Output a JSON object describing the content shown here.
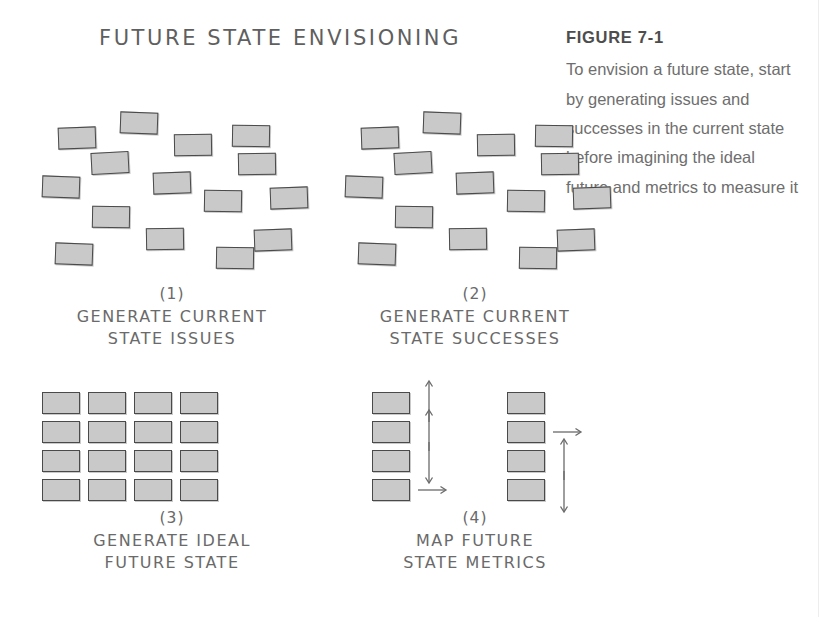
{
  "figure": {
    "number_label": "FIGURE 7-1",
    "caption": "To envision a future state, start by generating issues and successes in the current state before imagining the ideal future and metrics to measure it"
  },
  "diagram": {
    "title": "FUTURE STATE ENVISIONING",
    "colors": {
      "note_fill": "#c9c9c9",
      "note_border": "#4a4a4a",
      "ink": "#6a6a6a",
      "caption_text": "#6e6e6e",
      "figure_heading": "#4d4d4d",
      "background": "#ffffff"
    },
    "panels": [
      {
        "id": "panel-1",
        "step_number": "(1)",
        "label_line1": "GENERATE CURRENT",
        "label_line2": "STATE ISSUES",
        "arrangement": "scatter",
        "note_count": 14,
        "notes": [
          {
            "x": 16,
            "y": 15,
            "rot": -2
          },
          {
            "x": 78,
            "y": 0,
            "rot": 2
          },
          {
            "x": 132,
            "y": 22,
            "rot": -1
          },
          {
            "x": 190,
            "y": 13,
            "rot": 1
          },
          {
            "x": 49,
            "y": 40,
            "rot": -3
          },
          {
            "x": 196,
            "y": 41,
            "rot": -1
          },
          {
            "x": 0,
            "y": 64,
            "rot": 2
          },
          {
            "x": 111,
            "y": 60,
            "rot": -2
          },
          {
            "x": 162,
            "y": 78,
            "rot": 1
          },
          {
            "x": 228,
            "y": 75,
            "rot": -2
          },
          {
            "x": 50,
            "y": 94,
            "rot": 1
          },
          {
            "x": 104,
            "y": 116,
            "rot": -1
          },
          {
            "x": 13,
            "y": 131,
            "rot": 2
          },
          {
            "x": 174,
            "y": 135,
            "rot": 1
          },
          {
            "x": 212,
            "y": 117,
            "rot": -2
          }
        ]
      },
      {
        "id": "panel-2",
        "step_number": "(2)",
        "label_line1": "GENERATE CURRENT",
        "label_line2": "STATE SUCCESSES",
        "arrangement": "scatter",
        "note_count": 14,
        "notes": [
          {
            "x": 16,
            "y": 15,
            "rot": -2
          },
          {
            "x": 78,
            "y": 0,
            "rot": 2
          },
          {
            "x": 132,
            "y": 22,
            "rot": -1
          },
          {
            "x": 190,
            "y": 13,
            "rot": 1
          },
          {
            "x": 49,
            "y": 40,
            "rot": -3
          },
          {
            "x": 196,
            "y": 41,
            "rot": -1
          },
          {
            "x": 0,
            "y": 64,
            "rot": 2
          },
          {
            "x": 111,
            "y": 60,
            "rot": -2
          },
          {
            "x": 162,
            "y": 78,
            "rot": 1
          },
          {
            "x": 228,
            "y": 75,
            "rot": -2
          },
          {
            "x": 50,
            "y": 94,
            "rot": 1
          },
          {
            "x": 104,
            "y": 116,
            "rot": -1
          },
          {
            "x": 13,
            "y": 131,
            "rot": 2
          },
          {
            "x": 174,
            "y": 135,
            "rot": 1
          },
          {
            "x": 212,
            "y": 117,
            "rot": -2
          }
        ]
      },
      {
        "id": "panel-3",
        "step_number": "(3)",
        "label_line1": "GENERATE IDEAL",
        "label_line2": "FUTURE STATE",
        "arrangement": "grid",
        "grid_columns": 4,
        "grid_rows": 4,
        "note_count": 16
      },
      {
        "id": "panel-4",
        "step_number": "(4)",
        "label_line1": "MAP FUTURE",
        "label_line2": "STATE METRICS",
        "arrangement": "two-columns-with-arrows",
        "note_count": 8,
        "columns": [
          {
            "name": "left-metric-column",
            "arrows": [
              "up",
              "up",
              "down",
              "right"
            ]
          },
          {
            "name": "right-metric-column",
            "arrows": [
              "none",
              "right",
              "up",
              "down"
            ]
          }
        ]
      }
    ]
  }
}
